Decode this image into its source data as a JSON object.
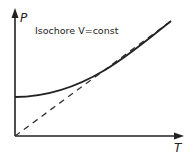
{
  "diagram": {
    "title": "Isochore V=const",
    "y_axis_label": "P",
    "x_axis_label": "T",
    "curves": [
      {
        "name": "real-gas-isochore",
        "style": "solid"
      },
      {
        "name": "ideal-gas-isochore",
        "style": "dashed"
      }
    ],
    "colors": {
      "line": "#222222",
      "background": "#ffffff"
    }
  }
}
